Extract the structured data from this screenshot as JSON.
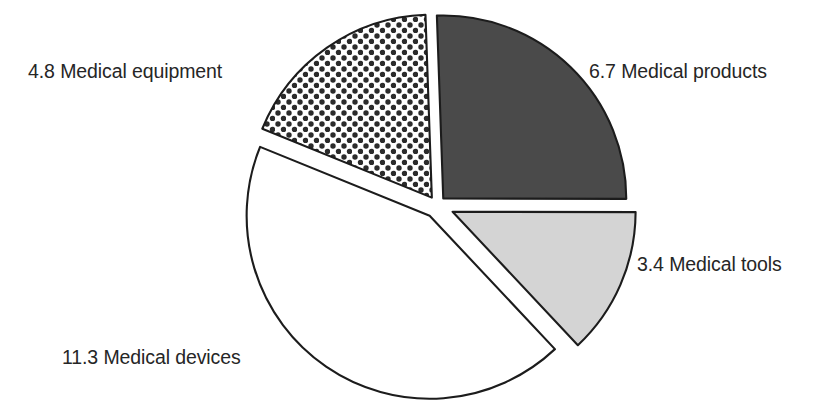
{
  "chart_data": {
    "type": "pie",
    "title": "",
    "subtitle": "",
    "xlabel": "",
    "ylabel": "",
    "legend_position": "none",
    "grid": false,
    "total": 26.2,
    "categories": [
      "Medical products",
      "Medical tools",
      "Medical devices",
      "Medical equipment"
    ],
    "values": [
      6.7,
      3.4,
      11.3,
      4.8
    ],
    "slices": [
      {
        "label": "Medical products",
        "value": 6.7,
        "value_text": "6.7",
        "label_text": "6.7 Medical products",
        "percent": 25.6,
        "angle_deg": 92.1,
        "start_angle_deg": -2.0,
        "end_angle_deg": 90.1,
        "fill": "#4a4a4a",
        "pattern": "solid-dark",
        "stroke": "#1c1c1c",
        "explode": 9
      },
      {
        "label": "Medical tools",
        "value": 3.4,
        "value_text": "3.4",
        "label_text": "3.4 Medical tools",
        "percent": 13.0,
        "angle_deg": 46.7,
        "start_angle_deg": 90.1,
        "end_angle_deg": 136.8,
        "fill": "#d4d4d4",
        "pattern": "solid-light",
        "stroke": "#1c1c1c",
        "explode": 17
      },
      {
        "label": "Medical devices",
        "value": 11.3,
        "value_text": "11.3",
        "label_text": "11.3 Medical devices",
        "percent": 43.1,
        "angle_deg": 155.3,
        "start_angle_deg": 136.8,
        "end_angle_deg": 292.1,
        "fill": "#ffffff",
        "pattern": "solid-white",
        "stroke": "#1c1c1c",
        "explode": 13
      },
      {
        "label": "Medical equipment",
        "value": 4.8,
        "value_text": "4.8",
        "label_text": "4.8 Medical equipment",
        "percent": 18.3,
        "angle_deg": 66.0,
        "start_angle_deg": 292.1,
        "end_angle_deg": 358.0,
        "fill": "#ffffff",
        "pattern": "polka-dots",
        "stroke": "#1c1c1c",
        "explode": 9
      }
    ]
  },
  "labels": {
    "equipment": "4.8 Medical equipment",
    "products": "6.7 Medical products",
    "tools": "3.4 Medical tools",
    "devices": "11.3 Medical devices"
  },
  "colors": {
    "dark_slice": "#4a4a4a",
    "light_slice": "#d4d4d4",
    "white_slice": "#ffffff",
    "outline": "#1c1c1c",
    "text": "#262626",
    "background": "#ffffff"
  }
}
